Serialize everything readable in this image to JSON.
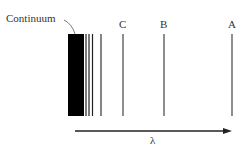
{
  "diagram": {
    "continuum_label": "Continuum",
    "axis_label": "λ",
    "lines": [
      {
        "name": "A",
        "x": 232
      },
      {
        "name": "B",
        "x": 164
      },
      {
        "name": "C",
        "x": 123
      }
    ],
    "unlabeled_lines_x": [
      86,
      89,
      92.5,
      101
    ],
    "continuum_block": {
      "x_start": 68,
      "x_end": 84
    },
    "colors": {
      "line": "#444444",
      "block": "#000000",
      "text": "#333333"
    }
  }
}
